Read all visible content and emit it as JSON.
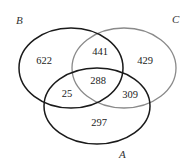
{
  "diagram": {
    "type": "venn-3",
    "sets": [
      {
        "id": "B",
        "label": "B",
        "color": "#1a1a1a"
      },
      {
        "id": "C",
        "label": "C",
        "color": "#8a8a8a"
      },
      {
        "id": "A",
        "label": "A",
        "color": "#1a1a1a"
      }
    ],
    "regions": {
      "B_only": "622",
      "B_C": "441",
      "C_only": "429",
      "A_B_C": "288",
      "A_B": "25",
      "A_C": "309",
      "A_only": "297"
    }
  }
}
